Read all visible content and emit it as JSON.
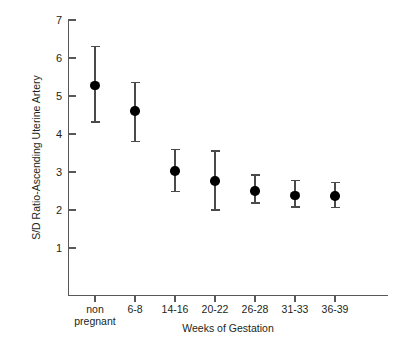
{
  "chart_data": {
    "type": "scatter",
    "title": "",
    "xlabel": "Weeks of Gestation",
    "ylabel": "S/D Ratio-Ascending Uterine Artery",
    "categories": [
      "non pregnant",
      "6-8",
      "14-16",
      "20-22",
      "26-28",
      "31-33",
      "36-39"
    ],
    "category_lines": [
      [
        "non",
        "pregnant"
      ],
      [
        "6-8"
      ],
      [
        "14-16"
      ],
      [
        "20-22"
      ],
      [
        "26-28"
      ],
      [
        "31-33"
      ],
      [
        "36-39"
      ]
    ],
    "values": [
      5.27,
      4.6,
      3.03,
      2.76,
      2.5,
      2.38,
      2.37
    ],
    "error_low": [
      4.32,
      3.8,
      2.48,
      2.0,
      2.18,
      2.08,
      2.07
    ],
    "error_high": [
      6.3,
      5.35,
      3.6,
      3.55,
      2.92,
      2.78,
      2.72
    ],
    "ylim": [
      0.6,
      7.2
    ],
    "yticks": [
      1,
      2,
      3,
      4,
      5,
      6,
      7
    ],
    "ytick_labels": [
      "1",
      "2",
      "3",
      "4",
      "5",
      "6",
      "7"
    ],
    "grid": false,
    "legend": "none",
    "marker_color": "#000000",
    "errorbar_color": "#4a4a4c",
    "axis_color": "#58585a",
    "background": "#ffffff"
  }
}
